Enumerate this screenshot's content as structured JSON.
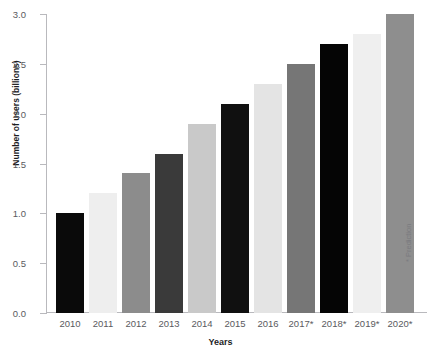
{
  "chart_data": {
    "type": "bar",
    "title": "",
    "title_clipped": true,
    "xlabel": "Years",
    "ylabel": "Number of users (billions)",
    "categories": [
      "2010",
      "2011",
      "2012",
      "2013",
      "2014",
      "2015",
      "2016",
      "2017*",
      "2018*",
      "2019*",
      "2020*"
    ],
    "values": [
      1.0,
      1.2,
      1.4,
      1.6,
      1.9,
      2.1,
      2.3,
      2.5,
      2.7,
      2.8,
      3.0
    ],
    "bar_colors": [
      "#0a0a0a",
      "#eeeeee",
      "#8c8c8c",
      "#3a3a3a",
      "#c9c9c9",
      "#101010",
      "#e4e4e4",
      "#767676",
      "#050505",
      "#efefef",
      "#8e8e8e"
    ],
    "ylim": [
      0.0,
      3.0
    ],
    "ytick_values": [
      0.0,
      0.5,
      1.0,
      1.5,
      2.0,
      2.5,
      3.0
    ],
    "ytick_labels": [
      "0.0",
      "0.5",
      "1.0",
      "1.5",
      "2.0",
      "2.5",
      "3.0"
    ],
    "grid": false,
    "legend": null,
    "annotations": [
      "* Prediction"
    ],
    "axis_color": "#b9b9bd"
  },
  "annotation": {
    "prediction_note": "* Prediction"
  }
}
